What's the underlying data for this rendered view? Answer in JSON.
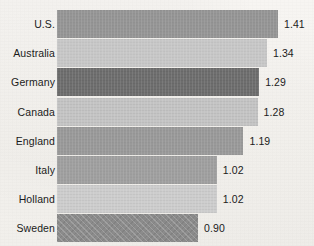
{
  "chart_data": {
    "type": "bar",
    "orientation": "horizontal",
    "title": "",
    "subtitle": "",
    "xlabel": "",
    "ylabel": "",
    "grid": false,
    "legend": false,
    "axis_visible": false,
    "value_labels_shown": true,
    "xlim": [
      0,
      1.41
    ],
    "categories": [
      "U.S.",
      "Australia",
      "Germany",
      "Canada",
      "England",
      "Italy",
      "Holland",
      "Sweden"
    ],
    "values": [
      1.41,
      1.34,
      1.29,
      1.28,
      1.19,
      1.02,
      1.02,
      0.9
    ],
    "value_label_format": "0.00",
    "bars": [
      {
        "label": "U.S.",
        "value": 1.41,
        "value_label": "1.41",
        "color": "#969696",
        "hatched": false
      },
      {
        "label": "Australia",
        "value": 1.34,
        "value_label": "1.34",
        "color": "#c8c8c8",
        "hatched": false
      },
      {
        "label": "Germany",
        "value": 1.29,
        "value_label": "1.29",
        "color": "#6e6e6e",
        "hatched": false
      },
      {
        "label": "Canada",
        "value": 1.28,
        "value_label": "1.28",
        "color": "#c4c4c4",
        "hatched": false
      },
      {
        "label": "England",
        "value": 1.19,
        "value_label": "1.19",
        "color": "#9a9a9a",
        "hatched": false
      },
      {
        "label": "Italy",
        "value": 1.02,
        "value_label": "1.02",
        "color": "#a0a0a0",
        "hatched": false
      },
      {
        "label": "Holland",
        "value": 1.02,
        "value_label": "1.02",
        "color": "#cdcdcd",
        "hatched": false
      },
      {
        "label": "Sweden",
        "value": 0.9,
        "value_label": "0.90",
        "color": "#8c8c8c",
        "hatched": true
      }
    ]
  },
  "layout": {
    "bar_origin_x": 57,
    "px_per_unit": 156.7,
    "bar_height": 28,
    "row_pitch": 29.2,
    "first_row_top": 10,
    "value_gap": 6,
    "background_color": "#f4f2ee",
    "text_color": "#1b1b1b"
  }
}
